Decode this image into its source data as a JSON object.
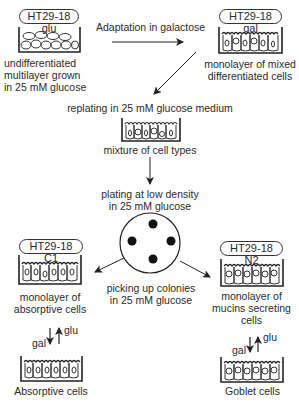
{
  "diagram": {
    "stages": {
      "glu": {
        "label": "HT29-18 glu",
        "caption": [
          "undifferentiated",
          "multilayer grown",
          "in 25 mM glucose"
        ]
      },
      "gal": {
        "label": "HT29-18 gal",
        "caption": [
          "monolayer of mixed",
          "differentiated cells"
        ]
      },
      "mixture": {
        "step": "replating in 25 mM glucose medium",
        "caption": "mixture of cell types"
      },
      "plating": {
        "step": [
          "plating at low density",
          "in 25 mM glucose"
        ]
      },
      "c1": {
        "label": "HT29-18 C1",
        "caption": [
          "monolayer of",
          "absorptive cells"
        ],
        "final": "Absorptive cells"
      },
      "n2": {
        "label": "HT29-18 N2",
        "caption": [
          "monolayer of",
          "mucins secreting",
          "cells"
        ],
        "final": "Goblet cells"
      }
    },
    "edges": {
      "adaptation": "Adaptation in galactose",
      "picking": [
        "picking up colonies",
        "in 25 mM glucose"
      ],
      "switch_down": "gal",
      "switch_up": "glu"
    },
    "colony_count": 4
  }
}
